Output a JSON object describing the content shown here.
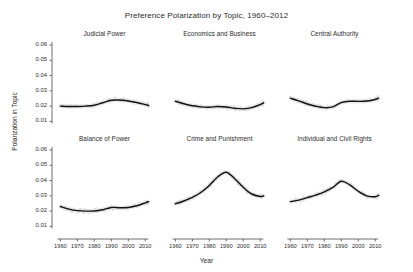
{
  "chart_data": {
    "type": "line",
    "title": "Preference Polarization by Topic, 1960–2012",
    "xlabel": "Year",
    "ylabel": "Polarization in Topic",
    "layout": {
      "rows": 2,
      "cols": 3,
      "grid": false,
      "legend": "none",
      "facet_style": "small-multiples"
    },
    "xlim": [
      1958,
      2014
    ],
    "ylim": [
      0.005,
      0.062
    ],
    "xticks": [
      1960,
      1970,
      1980,
      1990,
      2000,
      2010
    ],
    "xticklabels": [
      "1960",
      "1970",
      "1980",
      "1990",
      "2000",
      "2010"
    ],
    "yticks": [
      0.01,
      0.02,
      0.03,
      0.04,
      0.05,
      0.06
    ],
    "yticklabels": [
      "0.01",
      "0.02",
      "0.03",
      "0.04",
      "0.05",
      "0.06"
    ],
    "x": [
      1960,
      1965,
      1970,
      1975,
      1980,
      1985,
      1990,
      1995,
      2000,
      2005,
      2010,
      2012
    ],
    "panels": [
      {
        "name": "Judicial Power",
        "row": 0,
        "col": 0,
        "values": [
          0.02,
          0.0198,
          0.0198,
          0.02,
          0.0206,
          0.0222,
          0.0238,
          0.024,
          0.0234,
          0.0224,
          0.021,
          0.0204
        ]
      },
      {
        "name": "Economics and Business",
        "row": 0,
        "col": 1,
        "values": [
          0.0232,
          0.0215,
          0.0202,
          0.0195,
          0.0193,
          0.0197,
          0.0194,
          0.0186,
          0.0182,
          0.019,
          0.021,
          0.0222
        ]
      },
      {
        "name": "Central Authority",
        "row": 0,
        "col": 2,
        "values": [
          0.0252,
          0.0234,
          0.0214,
          0.0199,
          0.019,
          0.0195,
          0.0223,
          0.0232,
          0.0231,
          0.0233,
          0.0243,
          0.0252
        ]
      },
      {
        "name": "Balance of Power",
        "row": 1,
        "col": 0,
        "values": [
          0.023,
          0.0213,
          0.0203,
          0.02,
          0.0201,
          0.0209,
          0.0224,
          0.0222,
          0.0224,
          0.0235,
          0.0254,
          0.0262
        ]
      },
      {
        "name": "Crime and Punishment",
        "row": 1,
        "col": 1,
        "values": [
          0.0248,
          0.0266,
          0.029,
          0.0322,
          0.0368,
          0.0425,
          0.0455,
          0.0412,
          0.0356,
          0.0312,
          0.0296,
          0.03
        ]
      },
      {
        "name": "Individual and Civil Rights",
        "row": 1,
        "col": 2,
        "values": [
          0.0262,
          0.0272,
          0.0288,
          0.0305,
          0.0326,
          0.0355,
          0.0396,
          0.0372,
          0.033,
          0.03,
          0.0294,
          0.0303
        ]
      }
    ]
  },
  "figure": {
    "title": "Preference Polarization by Topic, 1960–2012",
    "xlabel": "Year",
    "ylabel": "Polarization in Topic"
  }
}
